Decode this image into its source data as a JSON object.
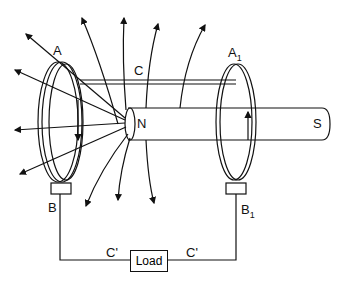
{
  "diagram": {
    "type": "homopolar-generator",
    "labels": {
      "A": "A",
      "A1": "A",
      "A1_sub": "1",
      "B": "B",
      "B1": "B",
      "B1_sub": "1",
      "C": "C",
      "N": "N",
      "S": "S",
      "C_prime_left": "C'",
      "C_prime_right": "C'",
      "load": "Load"
    },
    "colors": {
      "line": "#111111",
      "background": "#ffffff"
    }
  }
}
